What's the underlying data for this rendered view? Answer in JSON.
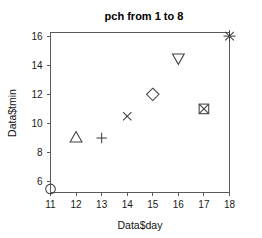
{
  "chart_data": {
    "type": "scatter",
    "title": "pch from 1 to 8",
    "xlabel": "Data$day",
    "ylabel": "Data$tmin",
    "x": [
      11,
      12,
      13,
      14,
      15,
      16,
      17,
      18
    ],
    "y": [
      5.5,
      9.0,
      9.0,
      10.5,
      12.0,
      14.5,
      11.0,
      16.0
    ],
    "point_labels": [
      "pch=1 circle",
      "pch=2 triangle",
      "pch=3 plus",
      "pch=4 cross",
      "pch=5 diamond",
      "pch=6 down-triangle",
      "pch=7 square-cross",
      "pch=8 star"
    ],
    "markers": [
      "circle",
      "triangle-up",
      "plus",
      "cross",
      "diamond",
      "triangle-down",
      "square-cross",
      "star"
    ],
    "pch_values": [
      1,
      2,
      3,
      4,
      5,
      6,
      7,
      8
    ],
    "xticks": [
      11,
      12,
      13,
      14,
      15,
      16,
      17,
      18
    ],
    "xtick_labels": [
      "11",
      "12",
      "13",
      "14",
      "15",
      "16",
      "17",
      "18"
    ],
    "yticks": [
      6,
      8,
      10,
      12,
      14,
      16
    ],
    "ytick_labels": [
      "6",
      "8",
      "10",
      "12",
      "14",
      "16"
    ],
    "xlim": [
      11,
      18
    ],
    "ylim": [
      5.29,
      16.25
    ],
    "grid": false,
    "legend": false,
    "marker_color": "#404040",
    "axis_color": "#5a5a5a",
    "background": "#ffffff",
    "text_color": "#111111"
  }
}
